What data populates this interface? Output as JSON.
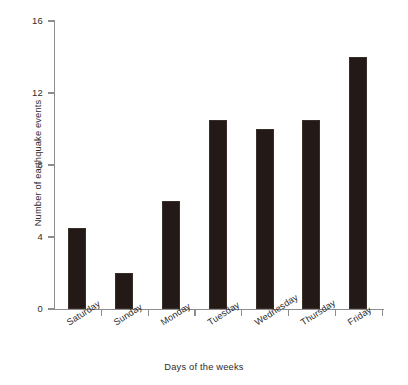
{
  "chart_data": {
    "type": "bar",
    "title": "",
    "xlabel": "Days of the weeks",
    "ylabel": "Number of earthquake events",
    "categories": [
      "Saturday",
      "Sunday",
      "Monday",
      "Tuesday",
      "Wednesday",
      "Thursday",
      "Friday"
    ],
    "values": [
      4.5,
      2,
      6,
      10.5,
      10,
      10.5,
      14
    ],
    "ylim": [
      0,
      16
    ],
    "yticks": [
      0,
      4,
      8,
      12,
      16
    ],
    "ytick_labels": [
      "0",
      "4",
      "8",
      "12",
      "16"
    ],
    "grid": false,
    "legend": null,
    "bar_color": "#231a17",
    "axis_color": "#8d8d8d",
    "text_color": "#2b2b2b"
  },
  "axes": {
    "y_title": "Number of earthquake events",
    "x_title": "Days of the weeks"
  }
}
